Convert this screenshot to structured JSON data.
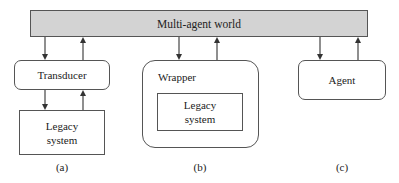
{
  "diagram": {
    "world": {
      "label": "Multi-agent world",
      "fill": "#d3d3d3"
    },
    "panels": [
      {
        "caption": "(a)",
        "outer": {
          "label": "Transducer"
        },
        "inner": {
          "label_line1": "Legacy",
          "label_line2": "system"
        }
      },
      {
        "caption": "(b)",
        "outer": {
          "label": "Wrapper"
        },
        "inner": {
          "label_line1": "Legacy",
          "label_line2": "system"
        }
      },
      {
        "caption": "(c)",
        "outer": {
          "label": "Agent"
        }
      }
    ],
    "arrows": [
      {
        "from": "Multi-agent world",
        "to": "Transducer",
        "direction": "down"
      },
      {
        "from": "Transducer",
        "to": "Multi-agent world",
        "direction": "up"
      },
      {
        "from": "Transducer",
        "to": "Legacy system",
        "direction": "down"
      },
      {
        "from": "Legacy system",
        "to": "Transducer",
        "direction": "up"
      },
      {
        "from": "Multi-agent world",
        "to": "Wrapper",
        "direction": "down"
      },
      {
        "from": "Wrapper",
        "to": "Multi-agent world",
        "direction": "up"
      },
      {
        "from": "Multi-agent world",
        "to": "Agent",
        "direction": "down"
      },
      {
        "from": "Agent",
        "to": "Multi-agent world",
        "direction": "up"
      }
    ]
  }
}
